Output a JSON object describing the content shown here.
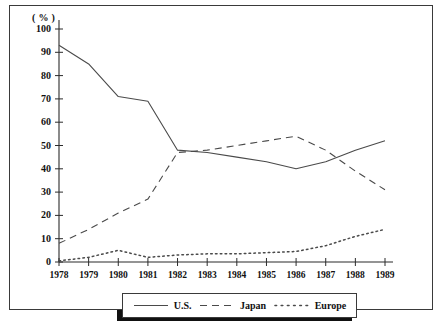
{
  "figure": {
    "y_unit_label": "( % )",
    "background": "#ffffff",
    "line_color": "#4a4a4a",
    "axis_color": "#2b2b2b",
    "frame_color": "#3a3a3a",
    "shadow_color": "#111111"
  },
  "legend": {
    "position": "bottom-center",
    "entries": [
      {
        "label": "U.S.",
        "style": "solid",
        "dash": "none"
      },
      {
        "label": "Japan",
        "style": "dashed",
        "dash": "7,5"
      },
      {
        "label": "Europe",
        "style": "dotted",
        "dash": "1.6,3.2"
      }
    ]
  },
  "chart_data": {
    "type": "line",
    "title": "",
    "subtitle": "",
    "xlabel": "",
    "ylabel": "( % )",
    "xlim": [
      1978,
      1989
    ],
    "ylim": [
      0,
      100
    ],
    "grid": false,
    "legend_position": "bottom-center",
    "x": [
      1978,
      1979,
      1980,
      1981,
      1982,
      1983,
      1984,
      1985,
      1986,
      1987,
      1988,
      1989
    ],
    "xtick_labels": [
      "1978",
      "1979",
      "1980",
      "1981",
      "1982",
      "1983",
      "1984",
      "1985",
      "1986",
      "1987",
      "1988",
      "1989"
    ],
    "ytick_labels": [
      "0",
      "10",
      "20",
      "30",
      "40",
      "50",
      "60",
      "70",
      "80",
      "90",
      "100"
    ],
    "yticks": [
      0,
      10,
      20,
      30,
      40,
      50,
      60,
      70,
      80,
      90,
      100
    ],
    "series": [
      {
        "name": "U.S.",
        "style": "solid",
        "values": [
          93,
          85,
          71,
          69,
          48,
          47,
          45,
          43,
          40,
          43,
          48,
          52
        ]
      },
      {
        "name": "Japan",
        "style": "dashed",
        "values": [
          8,
          14,
          21,
          27,
          47,
          48,
          50,
          52,
          54,
          48,
          39,
          31
        ]
      },
      {
        "name": "Europe",
        "style": "dotted",
        "values": [
          0.5,
          2,
          5,
          2,
          3,
          3.5,
          3.5,
          4,
          4.5,
          7,
          11,
          14
        ]
      }
    ]
  }
}
